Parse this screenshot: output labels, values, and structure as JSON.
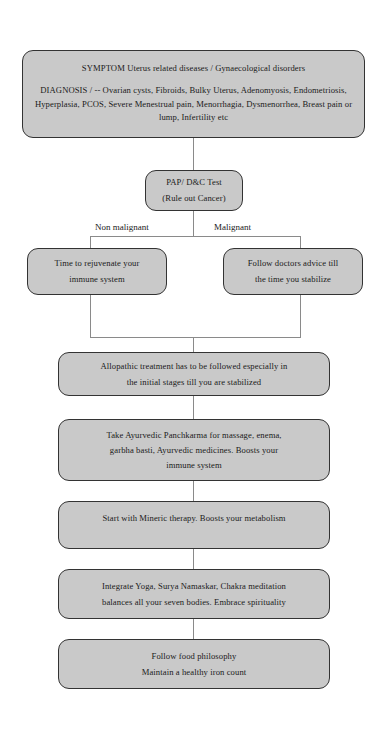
{
  "document": {
    "type": "flowchart",
    "title": "Uterus related diseases treatment flowchart",
    "background_color": "#ffffff",
    "node_fill_color": "#c9c9c9",
    "node_border_color": "#333333",
    "connector_color": "#8a8a8a",
    "text_color": "#1a1a1a"
  },
  "nodes": {
    "symptom": {
      "lines": [
        "SYMPTOM Uterus related diseases / Gynaecological disorders",
        "DIAGNOSIS / -- Ovarian cysts, Fibroids, Bulky Uterus, Adenomyosis, Endometriosis, Hyperplasia, PCOS, Severe Menestrual pain, Menorrhagia, Dysmenorrhea, Breast pain or lump, Infertility etc"
      ],
      "line1": "SYMPTOM Uterus related diseases / Gynaecological disorders",
      "line2": "DIAGNOSIS / -- Ovarian cysts, Fibroids, Bulky Uterus, Adenomyosis, Endometriosis, Hyperplasia, PCOS, Severe Menestrual pain, Menorrhagia, Dysmenorrhea, Breast pain or lump, Infertility etc"
    },
    "pap_test": {
      "line1": "PAP/ D&C Test",
      "line2": "(Rule out Cancer)"
    },
    "non_malignant_action": {
      "line1": "Time to rejuvenate your",
      "line2": "immune system"
    },
    "malignant_action": {
      "line1": "Follow doctors advice till",
      "line2": "the time you stabilize"
    },
    "allopathic": {
      "line1": "Allopathic treatment has to be followed especially in",
      "line2": "the initial stages till you are stabilized"
    },
    "panchkarma": {
      "line1": "Take Ayurvedic Panchkarma for massage, enema,",
      "line2": "garbha basti, Ayurvedic medicines. Boosts your",
      "line3": "immune system"
    },
    "mineric": {
      "line1": "Start with Mineric therapy. Boosts your metabolism"
    },
    "yoga": {
      "line1": "Integrate Yoga, Surya Namaskar, Chakra meditation",
      "line2": "balances all your seven bodies. Embrace spirituality"
    },
    "food": {
      "line1": "Follow food philosophy",
      "line2": "Maintain a healthy iron count"
    }
  },
  "branch_labels": {
    "non_malignant": "Non malignant",
    "malignant": "Malignant"
  }
}
